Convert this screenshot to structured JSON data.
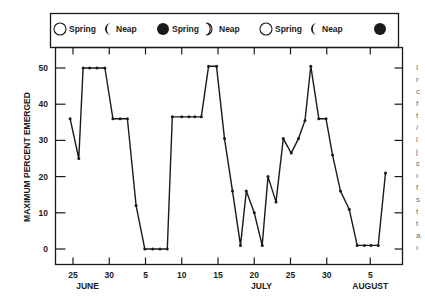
{
  "chart_data": {
    "type": "line",
    "title": "",
    "xlabel": "",
    "ylabel": "MAXIMUM PERCENT EMERGED",
    "ylim": [
      -3,
      55
    ],
    "yticks": [
      0,
      10,
      20,
      30,
      40,
      50
    ],
    "x_unit": "day index (June 1 = 1, July 1 = 31, August 1 = 62)",
    "xlim": [
      22.5,
      70
    ],
    "xticks": [
      {
        "x": 25,
        "label": "25"
      },
      {
        "x": 30,
        "label": "30"
      },
      {
        "x": 35,
        "label": "5"
      },
      {
        "x": 40,
        "label": "10"
      },
      {
        "x": 45,
        "label": "15"
      },
      {
        "x": 50,
        "label": "20"
      },
      {
        "x": 55,
        "label": "25"
      },
      {
        "x": 60,
        "label": "30"
      },
      {
        "x": 66,
        "label": "5"
      }
    ],
    "month_labels": [
      {
        "x": 27,
        "label": "JUNE"
      },
      {
        "x": 51,
        "label": "JULY"
      },
      {
        "x": 66,
        "label": "AUGUST"
      }
    ],
    "grid": false,
    "series": [
      {
        "name": "Maximum percent emerged",
        "x": [
          24.6,
          25.8,
          26.4,
          27.3,
          28.3,
          29.4,
          30.5,
          31.5,
          32.5,
          33.7,
          34.9,
          36,
          37,
          38,
          38.7,
          40,
          41,
          41.8,
          42.7,
          43.7,
          44.8,
          45.9,
          47,
          48.1,
          48.9,
          50,
          51.1,
          51.9,
          53,
          54,
          55.1,
          56.1,
          57,
          57.8,
          58.9,
          59.9,
          60.8,
          61.9,
          63.1,
          64.2,
          65.2,
          66.1,
          67.1,
          68.1
        ],
        "values": [
          36,
          25,
          50,
          50,
          50,
          50,
          36,
          36,
          36,
          12,
          0,
          0,
          0,
          0,
          36.5,
          36.5,
          36.5,
          36.5,
          36.5,
          50.5,
          50.5,
          30.5,
          16,
          1,
          16,
          10,
          1,
          20,
          13,
          30.5,
          26.5,
          30.5,
          35.5,
          50.5,
          36,
          36,
          26,
          16,
          11,
          1,
          1,
          1,
          1,
          21
        ]
      }
    ],
    "legend": {
      "placement": "top",
      "items": [
        {
          "icon": "full-circle-open",
          "label": "Spring"
        },
        {
          "icon": "crescent-left-filled",
          "label": "Neap"
        },
        {
          "icon": "new-moon-filled",
          "label": "Spring"
        },
        {
          "icon": "crescent-right-open",
          "label": "Neap"
        },
        {
          "icon": "full-circle-open",
          "label": "Spring"
        },
        {
          "icon": "crescent-left-filled",
          "label": "Neap"
        },
        {
          "icon": "new-moon-filled",
          "label": ""
        }
      ]
    }
  },
  "edge_text_fragments": [
    "I",
    "r",
    "c",
    "f",
    "t",
    "/",
    "l",
    "j",
    "ɛ",
    "ı",
    "f",
    "s",
    "t",
    "t",
    "a",
    "ı"
  ]
}
